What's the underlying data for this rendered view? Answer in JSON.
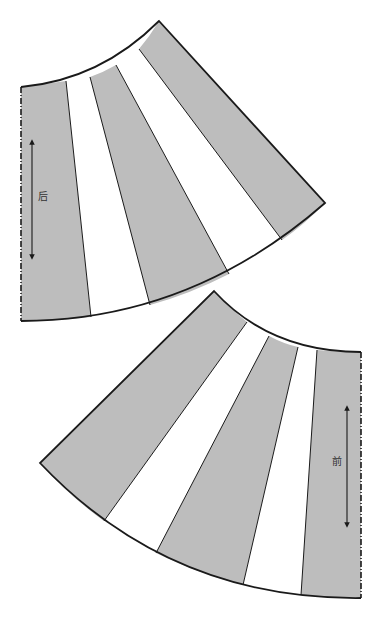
{
  "diagram": {
    "type": "skirt-pattern-pieces",
    "colors": {
      "panel_fill": "#bdbdbd",
      "gap_fill": "#ffffff",
      "outline": "#1a1a1a",
      "background": "#ffffff"
    },
    "pieces": [
      {
        "id": "back",
        "label": "后",
        "grainline": "vertical double-headed arrow",
        "fold_edge": "left (dashed)",
        "panels": 3,
        "gaps": 2
      },
      {
        "id": "front",
        "label": "前",
        "grainline": "vertical double-headed arrow",
        "fold_edge": "right (dashed)",
        "panels": 3,
        "gaps": 2
      }
    ],
    "caption": ""
  }
}
